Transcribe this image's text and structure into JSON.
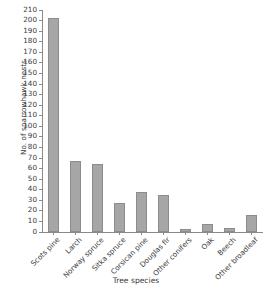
{
  "chart_data": {
    "type": "bar",
    "title": "",
    "xlabel": "Tree species",
    "ylabel": "No. of sparrowhawk nests",
    "categories": [
      "Scots pine",
      "Larch",
      "Norway spruce",
      "Sitka spruce",
      "Corsican pine",
      "Douglas fir",
      "Other conifers",
      "Oak",
      "Beech",
      "Other broadleaf"
    ],
    "values": [
      202,
      67,
      64,
      27,
      38,
      35,
      3,
      8,
      4,
      16
    ],
    "ylim": [
      0,
      210
    ],
    "ytick_step": 10,
    "yticks": [
      0,
      10,
      20,
      30,
      40,
      50,
      60,
      70,
      80,
      90,
      100,
      110,
      120,
      130,
      140,
      150,
      160,
      170,
      180,
      190,
      200,
      210
    ],
    "grid": false,
    "legend": "none",
    "bar_color": "#a6a6a6",
    "bar_edge_color": "#8c8c8c",
    "axis_color": "#8a8a8a",
    "text_color": "#3a3a3a",
    "background": "#ffffff"
  }
}
